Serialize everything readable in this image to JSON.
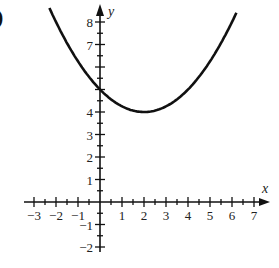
{
  "panel_label": ")",
  "chart_data": {
    "type": "line",
    "title": "",
    "xlabel": "x",
    "ylabel": "y",
    "x_tick_labels": [
      "-3",
      "-2",
      "-1",
      "1",
      "2",
      "3",
      "4",
      "5",
      "6",
      "7"
    ],
    "y_tick_labels": [
      "-2",
      "-1",
      "1",
      "2",
      "3",
      "4",
      "7",
      "8"
    ],
    "minor_tick_step": 0.5,
    "xlim": [
      -3.3,
      7.6
    ],
    "ylim": [
      -2.4,
      8.8
    ],
    "grid": false,
    "series": [
      {
        "name": "parabola",
        "equation": "y = (x - 2)^2 / 4 + 4",
        "vertex": [
          2,
          4
        ],
        "y_intercept": 5,
        "x": [
          -2.3,
          -2,
          -1,
          0,
          1,
          2,
          3,
          4,
          5,
          6,
          6.2
        ],
        "y": [
          8.62,
          8.0,
          6.25,
          5.0,
          4.25,
          4.0,
          4.25,
          5.0,
          6.25,
          8.0,
          8.41
        ]
      }
    ]
  }
}
